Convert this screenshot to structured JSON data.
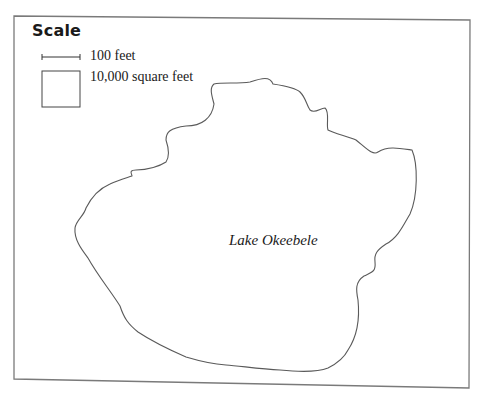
{
  "figure": {
    "type": "lake-area-estimation-map",
    "frame_color": "#6e6e6e",
    "outline_color": "#5a5a5a"
  },
  "legend": {
    "title": "Scale",
    "items": [
      {
        "symbol": "line-segment",
        "label": "100 feet"
      },
      {
        "symbol": "square",
        "label": "10,000 square feet"
      }
    ]
  },
  "map": {
    "lake_name": "Lake Okeebele"
  }
}
